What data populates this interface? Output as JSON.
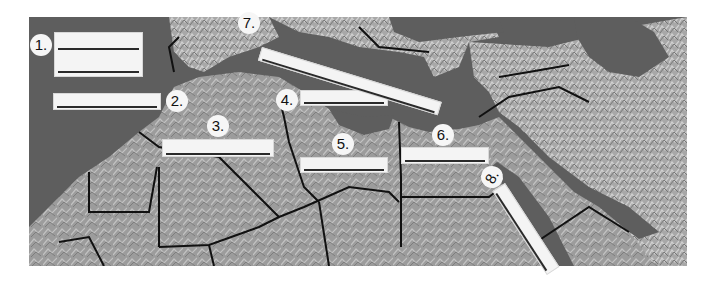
{
  "map": {
    "type": "blank outline worksheet map",
    "region": "North Africa and Southwest Asia",
    "colors": {
      "water": "#5e5e5e",
      "land": "#9a9a9a",
      "relief_light": "#c4c4c4",
      "border": "#111111",
      "label_box": "#f4f4f4",
      "answer_line": "#2a2a2a"
    }
  },
  "labels": [
    {
      "number": "1.",
      "answer_lines": 2
    },
    {
      "number": "2.",
      "answer_lines": 1
    },
    {
      "number": "3.",
      "answer_lines": 1
    },
    {
      "number": "4.",
      "answer_lines": 1
    },
    {
      "number": "5.",
      "answer_lines": 1
    },
    {
      "number": "6.",
      "answer_lines": 1
    },
    {
      "number": "7.",
      "answer_lines": 1
    },
    {
      "number": "8.",
      "answer_lines": 1
    }
  ]
}
